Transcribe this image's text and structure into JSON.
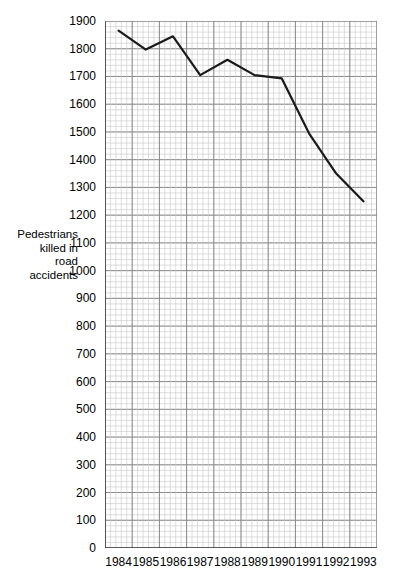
{
  "chart_data": {
    "type": "line",
    "title": "",
    "xlabel": "",
    "ylabel": "Pedestrians killed in road accidents",
    "categories": [
      "1984",
      "1985",
      "1986",
      "1987",
      "1988",
      "1989",
      "1990",
      "1991",
      "1992",
      "1993"
    ],
    "values": [
      1865,
      1797,
      1845,
      1705,
      1760,
      1705,
      1693,
      1495,
      1350,
      1250
    ],
    "series": [
      {
        "name": "Pedestrians killed in road accidents",
        "values": [
          1865,
          1797,
          1845,
          1705,
          1760,
          1705,
          1693,
          1495,
          1350,
          1250
        ]
      }
    ],
    "ylim": [
      0,
      1900
    ],
    "xlim": [
      "1984",
      "1993"
    ],
    "ytick_step": 100,
    "yticks": [
      0,
      100,
      200,
      300,
      400,
      500,
      600,
      700,
      800,
      900,
      1000,
      1100,
      1200,
      1300,
      1400,
      1500,
      1600,
      1700,
      1800,
      1900
    ],
    "ytick_labels": [
      "0",
      "100",
      "200",
      "300",
      "400",
      "500",
      "600",
      "700",
      "800",
      "900",
      "1000",
      "1100",
      "1200",
      "1300",
      "1400",
      "1500",
      "1600",
      "1700",
      "1800",
      "1900"
    ],
    "grid": true,
    "grid_style": "graph-paper minor and major gridlines",
    "minor_gridlines_per_major": 5,
    "legend": false,
    "legend_position": "none",
    "line_color": "#1a1a1a",
    "grid_major_color": "#808080",
    "grid_minor_color": "#c8c8c8",
    "axis_color": "#3a3a3a",
    "background_color": "#ffffff"
  },
  "axis_titles": {
    "y_label_lines": "Pedestrians\nkilled in\nroad\naccidents"
  }
}
